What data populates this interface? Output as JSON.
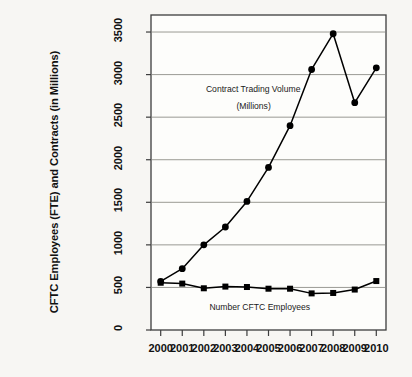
{
  "chart_data": {
    "type": "line",
    "title": "",
    "xlabel": "",
    "ylabel": "CFTC Employees (FTE) and Contracts (in Millions)",
    "categories": [
      "2000",
      "2001",
      "2002",
      "2003",
      "2004",
      "2005",
      "2006",
      "2007",
      "2008",
      "2009",
      "2010"
    ],
    "x": [
      2000,
      2001,
      2002,
      2003,
      2004,
      2005,
      2006,
      2007,
      2008,
      2009,
      2010
    ],
    "xlim": [
      1999.55,
      2010.45
    ],
    "ylim": [
      0,
      3700
    ],
    "yticks": [
      0,
      500,
      1000,
      1500,
      2000,
      2500,
      3000,
      3500
    ],
    "ytick_labels": [
      "0",
      "500",
      "1000",
      "1500",
      "2000",
      "2500",
      "3000",
      "3500"
    ],
    "grid": "horizontal",
    "legend": "none",
    "series": [
      {
        "name": "Contract Trading Volume (Millions)",
        "marker": "circle",
        "color": "#000000",
        "values": [
          570,
          720,
          1000,
          1210,
          1510,
          1910,
          2400,
          3060,
          3480,
          2670,
          3080
        ]
      },
      {
        "name": "Number CFTC Employees",
        "marker": "square",
        "color": "#000000",
        "values": [
          555,
          545,
          490,
          510,
          505,
          485,
          485,
          430,
          435,
          475,
          575
        ]
      }
    ],
    "annotations": [
      {
        "text": "Contract Trading Volume",
        "x": 2004.3,
        "y": 2820
      },
      {
        "text": "(Millions)",
        "x": 2004.3,
        "y": 2620
      },
      {
        "text": "Number CFTC Employees",
        "x": 2004.6,
        "y": 260
      }
    ]
  },
  "axis": {
    "y_title": "CFTC Employees (FTE) and Contracts (in Millions)",
    "y_ticks": [
      "0",
      "500",
      "1000",
      "1500",
      "2000",
      "2500",
      "3000",
      "3500"
    ],
    "x_ticks": [
      "2000",
      "2001",
      "2002",
      "2003",
      "2004",
      "2005",
      "2006",
      "2007",
      "2008",
      "2009",
      "2010"
    ]
  },
  "annotations": {
    "volume_line_1": "Contract Trading Volume",
    "volume_line_2": "(Millions)",
    "employees_label": "Number CFTC Employees"
  },
  "colors": {
    "background": "#f7f6f3",
    "line": "#000000",
    "grid": "#9a9a94",
    "frame": "#3d3d3d",
    "text": "#111111"
  }
}
